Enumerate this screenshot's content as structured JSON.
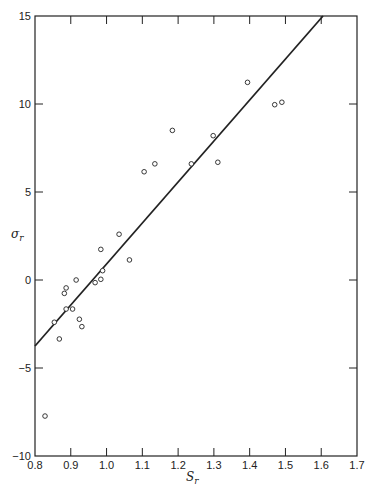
{
  "chart_data": {
    "type": "scatter",
    "title": "",
    "xlabel": "S_r",
    "ylabel": "σ_r",
    "xlabel_display": "S",
    "xlabel_sub": "r",
    "ylabel_display": "σ",
    "ylabel_sub": "r",
    "xlim": [
      0.8,
      1.7
    ],
    "ylim": [
      -10,
      15
    ],
    "x_ticks": [
      0.8,
      0.9,
      1.0,
      1.1,
      1.2,
      1.3,
      1.4,
      1.5,
      1.6,
      1.7
    ],
    "x_tick_labels": [
      "0.8",
      "0.9",
      "1.0",
      "1.1",
      "1.2",
      "1.3",
      "1.4",
      "1.5",
      "1.6",
      "1.7"
    ],
    "y_ticks": [
      -10,
      -5,
      0,
      5,
      10,
      15
    ],
    "y_tick_labels": [
      "−10",
      "−5",
      "0",
      "5",
      "10",
      "15"
    ],
    "grid": false,
    "legend": null,
    "series": [
      {
        "name": "observations",
        "marker": "open-circle",
        "x": [
          0.828,
          0.854,
          0.868,
          0.882,
          0.887,
          0.887,
          0.905,
          0.915,
          0.924,
          0.931,
          0.968,
          0.984,
          0.984,
          0.989,
          1.035,
          1.064,
          1.105,
          1.135,
          1.184,
          1.237,
          1.298,
          1.311,
          1.394,
          1.47,
          1.49
        ],
        "y": [
          -7.73,
          -2.4,
          -3.35,
          -0.76,
          -0.45,
          -1.65,
          -1.65,
          0.0,
          -2.23,
          -2.65,
          -0.15,
          0.04,
          1.74,
          0.53,
          2.6,
          1.14,
          6.15,
          6.6,
          8.5,
          6.6,
          8.2,
          6.69,
          11.23,
          9.96,
          10.1
        ]
      },
      {
        "name": "fitted line",
        "type": "line",
        "x": [
          0.8,
          1.605
        ],
        "y": [
          -3.75,
          15.0
        ]
      }
    ]
  },
  "colors": {
    "ink": "#222222",
    "background": "#ffffff"
  }
}
